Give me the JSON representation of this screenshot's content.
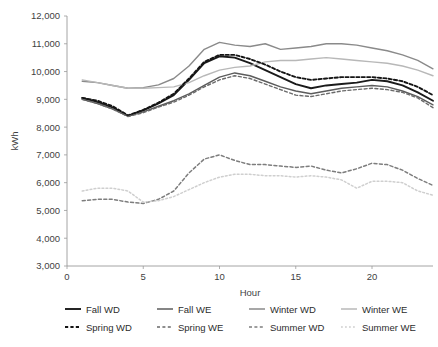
{
  "chart_data": {
    "type": "line",
    "title": "",
    "xlabel": "Hour",
    "ylabel": "kWh",
    "xlim": [
      0,
      24
    ],
    "ylim": [
      3000,
      12000
    ],
    "xticks": [
      0,
      5,
      10,
      15,
      20
    ],
    "yticks": [
      3000,
      4000,
      5000,
      6000,
      7000,
      8000,
      9000,
      10000,
      11000,
      12000
    ],
    "ytick_labels": [
      "3,000",
      "4,000",
      "5,000",
      "6,000",
      "7,000",
      "8,000",
      "9,000",
      "10,000",
      "11,000",
      "12,000"
    ],
    "xtick_labels": [
      "0",
      "5",
      "10",
      "15",
      "20"
    ],
    "grid": false,
    "legend_position": "bottom",
    "x": [
      1,
      2,
      3,
      4,
      5,
      6,
      7,
      8,
      9,
      10,
      11,
      12,
      13,
      14,
      15,
      16,
      17,
      18,
      19,
      20,
      21,
      22,
      23,
      24
    ],
    "series": [
      {
        "name": "Fall WD",
        "style": "solid",
        "color": "#1a1a1a",
        "width": 1.9,
        "values": [
          9050,
          8900,
          8700,
          8400,
          8600,
          8850,
          9150,
          9700,
          10300,
          10550,
          10500,
          10300,
          10050,
          9800,
          9550,
          9400,
          9500,
          9550,
          9600,
          9700,
          9650,
          9500,
          9250,
          8950
        ]
      },
      {
        "name": "Fall WE",
        "style": "solid",
        "color": "#5c5c5c",
        "width": 1.4,
        "values": [
          9000,
          8850,
          8650,
          8400,
          8550,
          8750,
          8950,
          9200,
          9500,
          9800,
          9950,
          9850,
          9650,
          9450,
          9300,
          9200,
          9300,
          9400,
          9450,
          9500,
          9450,
          9300,
          9100,
          8800
        ]
      },
      {
        "name": "Winter WD",
        "style": "solid",
        "color": "#8a8a8a",
        "width": 1.4,
        "values": [
          9650,
          9600,
          9500,
          9400,
          9420,
          9520,
          9750,
          10200,
          10800,
          11050,
          10950,
          10900,
          11000,
          10800,
          10850,
          10900,
          11000,
          11000,
          10950,
          10850,
          10750,
          10600,
          10400,
          10100
        ]
      },
      {
        "name": "Winter WE",
        "style": "solid",
        "color": "#b8b8b8",
        "width": 1.4,
        "values": [
          9700,
          9600,
          9500,
          9400,
          9400,
          9420,
          9450,
          9600,
          9850,
          10050,
          10150,
          10200,
          10350,
          10400,
          10400,
          10450,
          10500,
          10450,
          10400,
          10350,
          10300,
          10200,
          10050,
          9850
        ]
      },
      {
        "name": "Spring WD",
        "style": "dashed",
        "color": "#141414",
        "width": 1.9,
        "values": [
          9050,
          8950,
          8750,
          8420,
          8620,
          8880,
          9200,
          9750,
          10350,
          10600,
          10600,
          10450,
          10250,
          10000,
          9800,
          9700,
          9750,
          9800,
          9800,
          9800,
          9750,
          9650,
          9450,
          9150
        ]
      },
      {
        "name": "Spring WE",
        "style": "dashed",
        "color": "#6a6a6a",
        "width": 1.4,
        "values": [
          9000,
          8850,
          8650,
          8380,
          8520,
          8720,
          8900,
          9150,
          9450,
          9700,
          9850,
          9750,
          9550,
          9350,
          9150,
          9100,
          9200,
          9300,
          9350,
          9400,
          9350,
          9250,
          9050,
          8700
        ]
      },
      {
        "name": "Summer WD",
        "style": "dashed",
        "color": "#7d7d7d",
        "width": 1.5,
        "values": [
          5350,
          5400,
          5400,
          5300,
          5250,
          5400,
          5700,
          6350,
          6850,
          7000,
          6800,
          6650,
          6650,
          6600,
          6550,
          6600,
          6450,
          6350,
          6500,
          6700,
          6650,
          6450,
          6150,
          5900
        ]
      },
      {
        "name": "Summer WE",
        "style": "dotted",
        "color": "#cfcfcf",
        "width": 1.5,
        "values": [
          5700,
          5800,
          5800,
          5700,
          5300,
          5350,
          5500,
          5750,
          6000,
          6200,
          6300,
          6300,
          6250,
          6250,
          6200,
          6250,
          6200,
          6100,
          5800,
          6050,
          6050,
          6000,
          5700,
          5550
        ]
      }
    ]
  },
  "legend": {
    "items": [
      {
        "label": "Fall WD",
        "series": "Fall WD"
      },
      {
        "label": "Fall WE",
        "series": "Fall WE"
      },
      {
        "label": "Winter WD",
        "series": "Winter WD"
      },
      {
        "label": "Winter WE",
        "series": "Winter WE"
      },
      {
        "label": "Spring WD",
        "series": "Spring WD"
      },
      {
        "label": "Spring WE",
        "series": "Spring WE"
      },
      {
        "label": "Summer WD",
        "series": "Summer WD"
      },
      {
        "label": "Summer WE",
        "series": "Summer WE"
      }
    ]
  }
}
